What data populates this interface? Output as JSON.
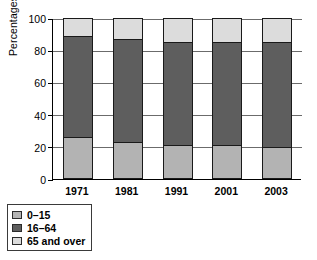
{
  "chart_data": {
    "type": "bar",
    "subtype": "stacked-bar-percent",
    "title": "",
    "xlabel": "",
    "ylabel": "Percentages",
    "ylim": [
      0,
      100
    ],
    "yticks": [
      0,
      20,
      40,
      60,
      80,
      100
    ],
    "ytick_labels": [
      "0",
      "20",
      "40",
      "60",
      "80",
      "100"
    ],
    "grid": true,
    "grid_axis": "y",
    "legend_position": "below-left",
    "categories": [
      "1971",
      "1981",
      "1991",
      "2001",
      "2003"
    ],
    "stack_order_bottom_to_top": [
      "0–15",
      "16–64",
      "65 and over"
    ],
    "series": [
      {
        "name": "0–15",
        "color": "#b3b3b3",
        "values": [
          25,
          22,
          20,
          20,
          19
        ]
      },
      {
        "name": "16–64",
        "color": "#5e5e5e",
        "values": [
          64,
          65,
          65,
          65,
          66
        ]
      },
      {
        "name": "65 and over",
        "color": "#dcdcdc",
        "values": [
          11,
          13,
          15,
          15,
          15
        ]
      }
    ],
    "units": "percent"
  },
  "colors": {
    "age_0_15": "#b3b3b3",
    "age_16_64": "#5e5e5e",
    "age_65_over": "#dcdcdc",
    "outline": "#1a1a1a",
    "gridline": "#6b6b6b",
    "background": "#ffffff"
  },
  "legend": {
    "items": [
      {
        "label": "0–15",
        "swatch": "age_0_15"
      },
      {
        "label": "16–64",
        "swatch": "age_16_64"
      },
      {
        "label": "65 and over",
        "swatch": "age_65_over"
      }
    ]
  }
}
